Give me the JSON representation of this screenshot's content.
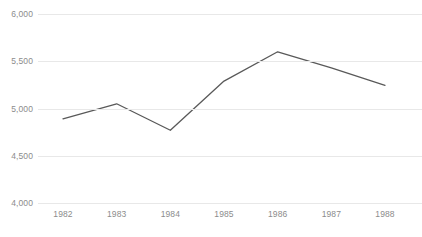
{
  "chart_data": {
    "type": "line",
    "title": "",
    "subtitle": "",
    "xlabel": "",
    "ylabel": "",
    "categories": [
      "1982",
      "1983",
      "1984",
      "1985",
      "1986",
      "1987",
      "1988"
    ],
    "x": [
      1982,
      1983,
      1984,
      1985,
      1986,
      1987,
      1988
    ],
    "values": [
      4890,
      5050,
      4770,
      5290,
      5600,
      5430,
      5245
    ],
    "series": [
      {
        "name": "",
        "color": "#595959",
        "values": [
          4890,
          5050,
          4770,
          5290,
          5600,
          5430,
          5245
        ]
      }
    ],
    "ylim": [
      4000,
      6000
    ],
    "yticks": [
      4000,
      4500,
      5000,
      5500,
      6000
    ],
    "ytick_labels": [
      "4,000",
      "4,500",
      "5,000",
      "5,500",
      "6,000"
    ],
    "xtick_labels": [
      "1982",
      "1983",
      "1984",
      "1985",
      "1986",
      "1987",
      "1988"
    ],
    "grid": true,
    "grid_axis": "y",
    "grid_color": "#e8e8e8",
    "legend": false,
    "legend_position": "none",
    "markers": false,
    "line_color": "#595959",
    "line_width": 1.3,
    "background_color": "#ffffff",
    "tick_label_color": "#8c8c8c"
  },
  "clipped_title_remnant": "▬"
}
